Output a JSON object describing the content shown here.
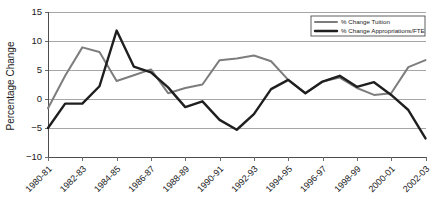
{
  "chart_data": {
    "type": "line",
    "title": "",
    "xlabel": "",
    "ylabel": "Percentage Change",
    "ylim": [
      -10,
      15
    ],
    "yticks": [
      15,
      10,
      5,
      0,
      -5,
      -10
    ],
    "ytick_labels": [
      "15",
      "10",
      "5",
      "0",
      "−5",
      "−10"
    ],
    "grid": true,
    "legend_position": "top-right",
    "categories": [
      "1980-81",
      "1981-82",
      "1982-83",
      "1983-84",
      "1984-85",
      "1985-86",
      "1986-87",
      "1987-88",
      "1988-89",
      "1989-90",
      "1990-91",
      "1991-92",
      "1992-93",
      "1993-94",
      "1994-95",
      "1995-96",
      "1996-97",
      "1997-98",
      "1998-99",
      "1999-00",
      "2000-01",
      "2001-02",
      "2002-03"
    ],
    "xtick_labels": [
      "1980-81",
      "1982-83",
      "1984-85",
      "1986-87",
      "1988-89",
      "1990-91",
      "1992-93",
      "1994-95",
      "1996-97",
      "1998-99",
      "2000-01",
      "2002-03"
    ],
    "xtick_indices": [
      0,
      2,
      4,
      6,
      8,
      10,
      12,
      14,
      16,
      18,
      20,
      22
    ],
    "series": [
      {
        "name": "% Change Tuition",
        "color": "#7d7d7d",
        "width": 2.0,
        "values": [
          -1.6,
          4.0,
          8.9,
          8.1,
          3.1,
          4.1,
          5.1,
          1.0,
          1.9,
          2.5,
          6.7,
          7.0,
          7.5,
          6.5,
          3.3,
          1.0,
          3.0,
          3.7,
          1.9,
          0.7,
          1.0,
          5.5,
          6.7
        ]
      },
      {
        "name": "% Change Appropriations/FTE",
        "color": "#1f1f1f",
        "width": 2.4,
        "values": [
          -5.0,
          -0.8,
          -0.8,
          2.2,
          11.8,
          5.6,
          4.6,
          2.0,
          -1.4,
          -0.4,
          -3.6,
          -5.3,
          -2.6,
          1.7,
          3.3,
          1.0,
          3.0,
          4.0,
          2.1,
          2.9,
          0.7,
          -1.9,
          -6.8
        ]
      }
    ]
  },
  "legend": {
    "entries": [
      {
        "label": "% Change Tuition"
      },
      {
        "label": "% Change Appropriations/FTE"
      }
    ]
  }
}
